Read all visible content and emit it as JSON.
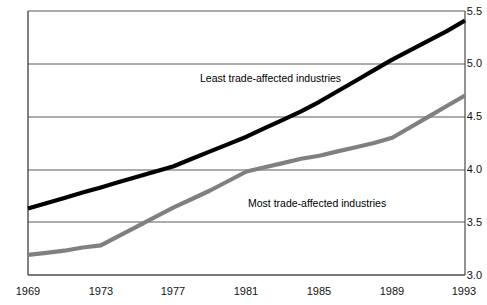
{
  "chart_data": {
    "type": "line",
    "title": "",
    "xlabel": "",
    "ylabel": "",
    "xlim": [
      1969,
      1993
    ],
    "ylim": [
      3.0,
      5.5
    ],
    "grid": true,
    "legend_position": "inline-annotation",
    "x_ticks": [
      "1969",
      "1973",
      "1977",
      "1981",
      "1985",
      "1989",
      "1993"
    ],
    "y_ticks": [
      "5.5",
      "5.0",
      "4.5",
      "4.0",
      "3.5",
      "3.0"
    ],
    "x": [
      1969,
      1970,
      1971,
      1972,
      1973,
      1974,
      1975,
      1976,
      1977,
      1978,
      1979,
      1980,
      1981,
      1982,
      1983,
      1984,
      1985,
      1986,
      1987,
      1988,
      1989,
      1990,
      1991,
      1992,
      1993
    ],
    "series": [
      {
        "name": "Least trade-affected industries",
        "color": "#000000",
        "values": [
          3.63,
          3.68,
          3.73,
          3.78,
          3.83,
          3.88,
          3.93,
          3.98,
          4.03,
          4.1,
          4.17,
          4.24,
          4.31,
          4.39,
          4.47,
          4.55,
          4.64,
          4.74,
          4.84,
          4.94,
          5.04,
          5.13,
          5.22,
          5.31,
          5.41
        ]
      },
      {
        "name": "Most trade-affected industries",
        "color": "#808080",
        "values": [
          3.19,
          3.21,
          3.23,
          3.26,
          3.28,
          3.37,
          3.46,
          3.55,
          3.64,
          3.72,
          3.8,
          3.89,
          3.98,
          4.02,
          4.06,
          4.1,
          4.13,
          4.17,
          4.21,
          4.25,
          4.3,
          4.4,
          4.5,
          4.6,
          4.7
        ]
      }
    ],
    "annotations": [
      {
        "text": "Least trade-affected industries",
        "x": 200,
        "y": 78
      },
      {
        "text": "Most trade-affected industries",
        "x": 248,
        "y": 197
      }
    ]
  }
}
